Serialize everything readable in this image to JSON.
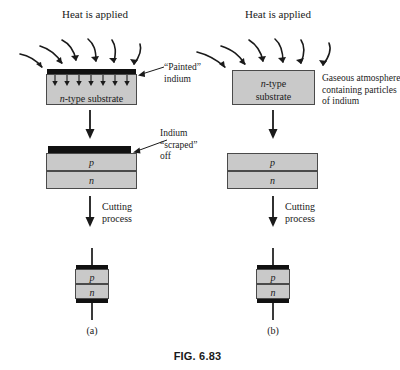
{
  "figure": {
    "caption": "FIG. 6.83",
    "panels": [
      {
        "letter": "(a)"
      },
      {
        "letter": "(b)"
      }
    ]
  },
  "colors": {
    "substrate_fill": "#c9c9c9",
    "substrate_stroke": "#4a4a4a",
    "indium_black": "#111111",
    "lead_wire": "#3a3a3a",
    "text": "#1a1a1a",
    "background": "#ffffff"
  },
  "panel_a": {
    "heat_label": "Heat is applied",
    "heat_arrow_count": 6,
    "diffusion_arrow_count": 7,
    "substrate_label_italic": "n",
    "substrate_label_rest": "-type substrate",
    "indium_note_line1": "“Painted”",
    "indium_note_line2": "indium",
    "scrape_note_line1": "Indium",
    "scrape_note_line2": "“scraped”",
    "scrape_note_line3": "off",
    "layer_p": "p",
    "layer_n": "n",
    "cutting_line1": "Cutting",
    "cutting_line2": "process",
    "chip_layer_p": "p",
    "chip_layer_n": "n"
  },
  "panel_b": {
    "heat_label": "Heat is applied",
    "heat_arrow_count": 6,
    "substrate_label_italic": "n",
    "substrate_label_rest": "-type",
    "substrate_label_line2": "substrate",
    "atmosphere_line1": "Gaseous atmosphere",
    "atmosphere_line2": "containing particles",
    "atmosphere_line3": "of indium",
    "layer_p": "p",
    "layer_n": "n",
    "cutting_line1": "Cutting",
    "cutting_line2": "process",
    "chip_layer_p": "p",
    "chip_layer_n": "n"
  }
}
